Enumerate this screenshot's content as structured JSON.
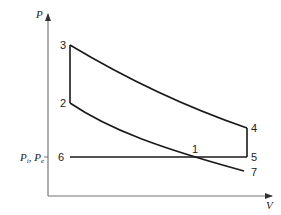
{
  "diagram": {
    "axes": {
      "y_label": "P",
      "x_label": "V",
      "y_tick_label": "P_i, P_e"
    },
    "points": [
      {
        "id": "1",
        "label": "1",
        "x": 195,
        "y": 157
      },
      {
        "id": "2",
        "label": "2",
        "x": 70,
        "y": 103
      },
      {
        "id": "3",
        "label": "3",
        "x": 70,
        "y": 45
      },
      {
        "id": "4",
        "label": "4",
        "x": 247,
        "y": 128
      },
      {
        "id": "5",
        "label": "5",
        "x": 247,
        "y": 157
      },
      {
        "id": "6",
        "label": "6",
        "x": 70,
        "y": 157
      },
      {
        "id": "7",
        "label": "7",
        "x": 244,
        "y": 171
      }
    ],
    "colors": {
      "curve": "#1a1a1a",
      "axis": "#777777"
    }
  }
}
